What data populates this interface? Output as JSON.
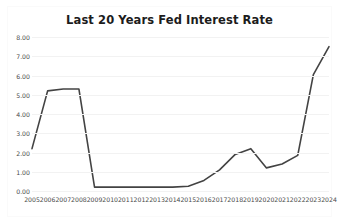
{
  "chart": {
    "title": "Last 20 Years Fed Interest Rate"
  },
  "chart_data": {
    "type": "line",
    "title": "Last 20 Years Fed Interest Rate",
    "xlabel": "",
    "ylabel": "",
    "categories": [
      "2005",
      "2006",
      "2007",
      "2008",
      "2009",
      "2010",
      "2011",
      "2012",
      "2013",
      "2014",
      "2015",
      "2016",
      "2017",
      "2018",
      "2019",
      "2020",
      "2021",
      "2022",
      "2023",
      "2024"
    ],
    "values": [
      2.2,
      5.2,
      5.3,
      5.3,
      0.2,
      0.2,
      0.2,
      0.2,
      0.2,
      0.2,
      0.25,
      0.55,
      1.1,
      1.9,
      2.2,
      1.2,
      1.4,
      1.85,
      6.05,
      7.5
    ],
    "series": [
      {
        "name": "Fed Interest Rate",
        "values": [
          2.2,
          5.2,
          5.3,
          5.3,
          0.2,
          0.2,
          0.2,
          0.2,
          0.2,
          0.2,
          0.25,
          0.55,
          1.1,
          1.9,
          2.2,
          1.2,
          1.4,
          1.85,
          6.05,
          7.5
        ]
      }
    ],
    "ylim": [
      0,
      8
    ],
    "ytick_labels": [
      "0.00",
      "1.00",
      "2.00",
      "3.00",
      "4.00",
      "5.00",
      "6.00",
      "7.00",
      "8.00"
    ],
    "ytick_values": [
      0,
      1,
      2,
      3,
      4,
      5,
      6,
      7,
      8
    ],
    "xtick_labels": [
      "2005",
      "2006",
      "2007",
      "2008",
      "2009",
      "2010",
      "2011",
      "2012",
      "2013",
      "2014",
      "2015",
      "2016",
      "2017",
      "2018",
      "2019",
      "2020",
      "2021",
      "2022",
      "2023",
      "2024"
    ],
    "grid": true,
    "legend": false,
    "line_color": "#434343",
    "grid_color": "#f2f2f2",
    "background_color": "#ffffff"
  }
}
